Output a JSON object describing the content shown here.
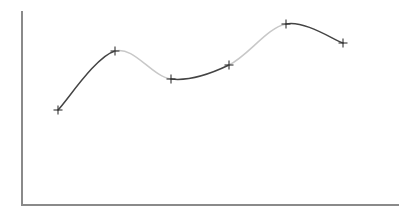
{
  "chart_data": {
    "type": "line",
    "title": "",
    "subtitle": "",
    "xlabel": "",
    "ylabel": "",
    "grid": false,
    "legend": false,
    "legend_position": "none",
    "x_tick_labels": [],
    "y_tick_labels": [],
    "xlim": [
      0,
      7
    ],
    "ylim": [
      0,
      10
    ],
    "marker": "plus",
    "interpolation": "smooth-spline",
    "series": [
      {
        "name": "series-1",
        "x": [
          1,
          2,
          3,
          4,
          5,
          6
        ],
        "values": [
          5.0,
          8.0,
          6.6,
          7.4,
          9.4,
          8.4
        ],
        "pixel_points": [
          {
            "x": 58,
            "y": 110
          },
          {
            "x": 115,
            "y": 51
          },
          {
            "x": 171,
            "y": 79
          },
          {
            "x": 229,
            "y": 65
          },
          {
            "x": 286,
            "y": 24
          },
          {
            "x": 343,
            "y": 43
          }
        ],
        "segment_colors": [
          "#444444",
          "#c8c8c8",
          "#444444",
          "#c8c8c8",
          "#444444"
        ]
      }
    ]
  },
  "axes": {
    "y_axis": {
      "x": 22,
      "y_top": 12,
      "y_bottom": 205,
      "color": "#8a8a8a"
    },
    "x_axis": {
      "y": 205,
      "x_left": 22,
      "x_right": 398,
      "color": "#8a8a8a"
    }
  },
  "style": {
    "background": "#ffffff",
    "marker_color": "#333333",
    "marker_size": 9,
    "dark_stroke": "#444444",
    "light_stroke": "#c8c8c8"
  }
}
